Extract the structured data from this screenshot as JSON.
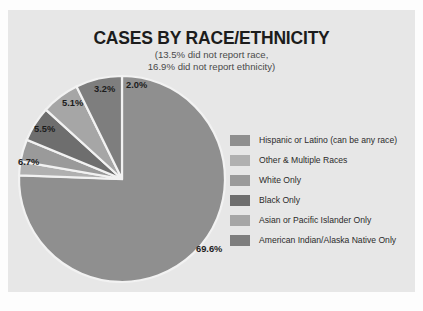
{
  "panel": {
    "background_color": "#e7e7e7"
  },
  "chart_data": {
    "type": "pie",
    "title": "CASES BY RACE/ETHNICITY",
    "subtitle_line1": "(13.5% did not report race,",
    "subtitle_line2": "16.9% did not report ethnicity)",
    "xlabel": "",
    "ylabel": "",
    "grid": false,
    "legend_position": "right",
    "start_angle_deg": 0,
    "direction": "clockwise",
    "categories": [
      "Hispanic or Latino (can be any race)",
      "Other & Multiple Races",
      "White Only",
      "Black Only",
      "Asian or Pacific Islander Only",
      "American Indian/Alaska Native Only"
    ],
    "values": [
      69.6,
      2.0,
      3.2,
      5.1,
      5.5,
      6.7
    ],
    "labels": [
      "69.6%",
      "2.0%",
      "3.2%",
      "5.1%",
      "5.5%",
      "6.7%"
    ],
    "colors": [
      "#8f8f8f",
      "#b0b0b0",
      "#9a9a9a",
      "#6e6e6e",
      "#a6a6a6",
      "#7e7e7e"
    ],
    "separator_color": "#f2f2f2"
  },
  "legend": {
    "items": [
      {
        "label": "Hispanic or Latino (can be any race)",
        "color": "#8f8f8f"
      },
      {
        "label": "Other & Multiple Races",
        "color": "#b0b0b0"
      },
      {
        "label": "White Only",
        "color": "#9a9a9a"
      },
      {
        "label": "Black Only",
        "color": "#6e6e6e"
      },
      {
        "label": "Asian or Pacific Islander Only",
        "color": "#a6a6a6"
      },
      {
        "label": "American Indian/Alaska Native Only",
        "color": "#7e7e7e"
      }
    ]
  },
  "slice_labels": {
    "big": {
      "text": "69.6%",
      "left": 180,
      "top": 172
    },
    "pct20": {
      "text": "2.0%",
      "left": 110,
      "top": 8
    },
    "pct32": {
      "text": "3.2%",
      "left": 78,
      "top": 12
    },
    "pct51": {
      "text": "5.1%",
      "left": 46,
      "top": 26
    },
    "pct55": {
      "text": "5.5%",
      "left": 18,
      "top": 52
    },
    "pct67": {
      "text": "6.7%",
      "left": 2,
      "top": 85
    }
  }
}
